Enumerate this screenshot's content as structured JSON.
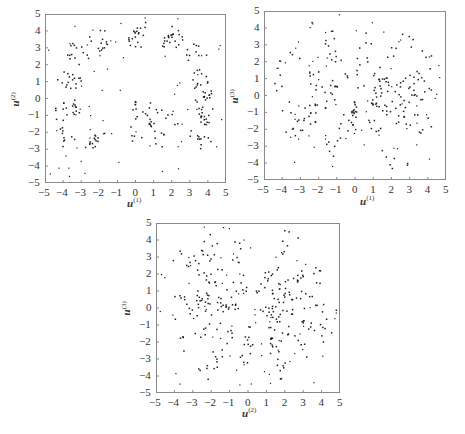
{
  "chart_data": [
    {
      "type": "scatter",
      "panel": "top-left",
      "xlabel": "u(1)",
      "ylabel": "u(2)",
      "xlim": [
        -5,
        5
      ],
      "ylim": [
        -5,
        5
      ],
      "xticks": [
        "-5",
        "-4",
        "-3",
        "-2",
        "-1",
        "0",
        "1",
        "2",
        "3",
        "4",
        "5"
      ],
      "yticks": [
        "5",
        "4",
        "3",
        "2",
        "1",
        "0",
        "-1",
        "-2",
        "-3",
        "-4",
        "-5"
      ],
      "grid": false,
      "description": "Points arranged along short radial line segments forming a ring (radius ~2-4.5) around the origin, plus a dense spike of points near (0,-1) extending toward (0,0) and a fan of points toward the lower right.",
      "clusters": [
        {
          "angle_deg": 90,
          "r": [
            3.0,
            4.5
          ]
        },
        {
          "angle_deg": 60,
          "r": [
            3.5,
            4.7
          ]
        },
        {
          "angle_deg": 40,
          "r": [
            3.5,
            4.8
          ]
        },
        {
          "angle_deg": 20,
          "r": [
            3.2,
            4.2
          ]
        },
        {
          "angle_deg": 5,
          "r": [
            3.3,
            4.2
          ]
        },
        {
          "angle_deg": -15,
          "r": [
            3.5,
            4.3
          ]
        },
        {
          "angle_deg": -35,
          "r": [
            3.6,
            4.8
          ]
        },
        {
          "angle_deg": 120,
          "r": [
            3.2,
            4.6
          ]
        },
        {
          "angle_deg": 140,
          "r": [
            3.5,
            4.8
          ]
        },
        {
          "angle_deg": 165,
          "r": [
            3.2,
            4.5
          ]
        },
        {
          "angle_deg": 190,
          "r": [
            3.2,
            4.5
          ]
        },
        {
          "angle_deg": 210,
          "r": [
            3.5,
            5.0
          ]
        },
        {
          "angle_deg": 230,
          "r": [
            2.5,
            4.0
          ]
        },
        {
          "angle_deg": -90,
          "r": [
            0.0,
            2.5
          ]
        },
        {
          "angle_deg": -60,
          "r": [
            0.8,
            3.2
          ]
        },
        {
          "angle_deg": -30,
          "r": [
            0.8,
            3.0
          ]
        }
      ]
    },
    {
      "type": "scatter",
      "panel": "top-right",
      "xlabel": "u(1)",
      "ylabel": "u(3)",
      "xlim": [
        -5,
        5
      ],
      "ylim": [
        -5,
        5
      ],
      "xticks": [
        "-5",
        "-4",
        "-3",
        "-2",
        "-1",
        "0",
        "1",
        "2",
        "3",
        "4",
        "5"
      ],
      "yticks": [
        "5",
        "4",
        "3",
        "2",
        "1",
        "0",
        "-1",
        "-2",
        "-3",
        "-4",
        "-5"
      ],
      "grid": false,
      "description": "Points along many radial line segments emanating from a dense hub near (0,0.2), spreading in all directions to radius ~5.",
      "clusters": [
        {
          "angle_deg": 80,
          "r": [
            0.2,
            3.8
          ]
        },
        {
          "angle_deg": 50,
          "r": [
            0.5,
            5.0
          ]
        },
        {
          "angle_deg": 30,
          "r": [
            1.0,
            4.8
          ]
        },
        {
          "angle_deg": 15,
          "r": [
            1.0,
            4.5
          ]
        },
        {
          "angle_deg": 0,
          "r": [
            1.0,
            4.3
          ]
        },
        {
          "angle_deg": -15,
          "r": [
            1.0,
            4.5
          ]
        },
        {
          "angle_deg": -30,
          "r": [
            1.0,
            4.8
          ]
        },
        {
          "angle_deg": -60,
          "r": [
            1.0,
            5.0
          ]
        },
        {
          "angle_deg": -95,
          "r": [
            0.2,
            2.5
          ]
        },
        {
          "angle_deg": -115,
          "r": [
            1.0,
            4.0
          ]
        },
        {
          "angle_deg": 150,
          "r": [
            1.0,
            4.8
          ]
        },
        {
          "angle_deg": 170,
          "r": [
            1.0,
            4.6
          ]
        },
        {
          "angle_deg": 190,
          "r": [
            1.0,
            4.8
          ]
        },
        {
          "angle_deg": 210,
          "r": [
            1.5,
            4.5
          ]
        },
        {
          "angle_deg": 115,
          "r": [
            1.0,
            5.0
          ]
        }
      ]
    },
    {
      "type": "scatter",
      "panel": "bottom-center",
      "xlabel": "u(2)",
      "ylabel": "u(3)",
      "xlim": [
        -5,
        5
      ],
      "ylim": [
        -5,
        5
      ],
      "xticks": [
        "-5",
        "-4",
        "-3",
        "-2",
        "-1",
        "0",
        "1",
        "2",
        "3",
        "4",
        "5"
      ],
      "yticks": [
        "5",
        "4",
        "3",
        "2",
        "1",
        "0",
        "-1",
        "-2",
        "-3",
        "-4",
        "-5"
      ],
      "grid": false,
      "description": "Points along radial line segments emanating from a hub near (0,0.1), with a dense horizontal band on the left at y ~0 to 1 and fans of segments to the right and lower right.",
      "clusters": [
        {
          "angle_deg": 175,
          "r": [
            0.2,
            4.0
          ]
        },
        {
          "angle_deg": 165,
          "r": [
            0.5,
            3.8
          ]
        },
        {
          "angle_deg": 185,
          "r": [
            0.5,
            4.0
          ]
        },
        {
          "angle_deg": 140,
          "r": [
            1.0,
            5.0
          ]
        },
        {
          "angle_deg": 120,
          "r": [
            1.0,
            5.0
          ]
        },
        {
          "angle_deg": 100,
          "r": [
            1.0,
            4.0
          ]
        },
        {
          "angle_deg": 60,
          "r": [
            1.0,
            5.0
          ]
        },
        {
          "angle_deg": 35,
          "r": [
            1.5,
            4.8
          ]
        },
        {
          "angle_deg": 15,
          "r": [
            1.5,
            4.3
          ]
        },
        {
          "angle_deg": -3,
          "r": [
            0.5,
            4.8
          ]
        },
        {
          "angle_deg": -20,
          "r": [
            1.0,
            4.8
          ]
        },
        {
          "angle_deg": -40,
          "r": [
            1.5,
            5.0
          ]
        },
        {
          "angle_deg": -60,
          "r": [
            1.5,
            5.0
          ]
        },
        {
          "angle_deg": -90,
          "r": [
            1.0,
            3.3
          ]
        },
        {
          "angle_deg": -120,
          "r": [
            1.5,
            5.0
          ]
        },
        {
          "angle_deg": -150,
          "r": [
            1.5,
            4.5
          ]
        }
      ]
    }
  ],
  "panels": [
    {
      "xlabel_main": "u",
      "xlabel_sup": "(1)",
      "ylabel_main": "u",
      "ylabel_sup": "(2)"
    },
    {
      "xlabel_main": "u",
      "xlabel_sup": "(1)",
      "ylabel_main": "u",
      "ylabel_sup": "(3)"
    },
    {
      "xlabel_main": "u",
      "xlabel_sup": "(2)",
      "ylabel_main": "u",
      "ylabel_sup": "(3)"
    }
  ],
  "style": {
    "point_color": "#222222",
    "frame_color": "#8a8a8a"
  }
}
